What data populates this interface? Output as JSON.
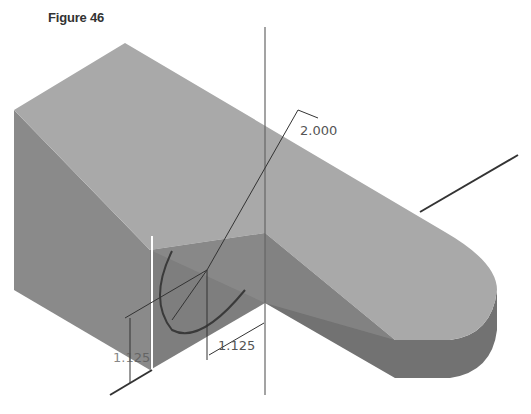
{
  "figure": {
    "caption": "Figure 46",
    "type": "isometric 3D part with sketch dimensions"
  },
  "dimensions": {
    "radius_label": "2.000",
    "horizontal_label": "1.125",
    "vertical_label": "1.125"
  },
  "colors": {
    "top_face": "#a9a9a9",
    "left_face": "#8a8a8a",
    "front_face": "#7c7c7c",
    "round_end_side": "#737373",
    "line": "#333333",
    "dim_text": "#555555",
    "background": "#ffffff"
  }
}
